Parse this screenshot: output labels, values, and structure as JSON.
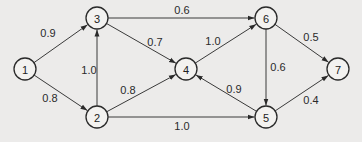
{
  "diagram": {
    "type": "directed-weighted-graph",
    "node_radius": 11,
    "colors": {
      "line": "#3a3a3a",
      "node_fill": "#f3f2f0",
      "background": "#ecebea"
    },
    "nodes": [
      {
        "id": "1",
        "label": "1",
        "x": 25,
        "y": 69
      },
      {
        "id": "2",
        "label": "2",
        "x": 97,
        "y": 117
      },
      {
        "id": "3",
        "label": "3",
        "x": 97,
        "y": 18
      },
      {
        "id": "4",
        "label": "4",
        "x": 186,
        "y": 69
      },
      {
        "id": "5",
        "label": "5",
        "x": 266,
        "y": 117
      },
      {
        "id": "6",
        "label": "6",
        "x": 266,
        "y": 18
      },
      {
        "id": "7",
        "label": "7",
        "x": 338,
        "y": 69
      }
    ],
    "edges": [
      {
        "from": "1",
        "to": "3",
        "weight": "0.9",
        "lx": 48,
        "ly": 33
      },
      {
        "from": "1",
        "to": "2",
        "weight": "0.8",
        "lx": 50,
        "ly": 98
      },
      {
        "from": "2",
        "to": "3",
        "weight": "1.0",
        "lx": 89,
        "ly": 70
      },
      {
        "from": "3",
        "to": "4",
        "weight": "0.7",
        "lx": 155,
        "ly": 42
      },
      {
        "from": "2",
        "to": "4",
        "weight": "0.8",
        "lx": 128,
        "ly": 90
      },
      {
        "from": "3",
        "to": "6",
        "weight": "0.6",
        "lx": 182,
        "ly": 10
      },
      {
        "from": "2",
        "to": "5",
        "weight": "1.0",
        "lx": 182,
        "ly": 126
      },
      {
        "from": "4",
        "to": "6",
        "weight": "1.0",
        "lx": 213,
        "ly": 41
      },
      {
        "from": "5",
        "to": "4",
        "weight": "0.9",
        "lx": 234,
        "ly": 89
      },
      {
        "from": "6",
        "to": "5",
        "weight": "0.6",
        "lx": 278,
        "ly": 67
      },
      {
        "from": "6",
        "to": "7",
        "weight": "0.5",
        "lx": 311,
        "ly": 37
      },
      {
        "from": "5",
        "to": "7",
        "weight": "0.4",
        "lx": 311,
        "ly": 100
      }
    ]
  }
}
